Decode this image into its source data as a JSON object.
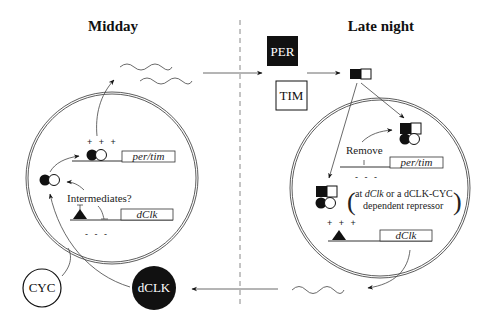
{
  "titles": {
    "left": "Midday",
    "right": "Late night"
  },
  "proteins": {
    "per": "PER",
    "tim": "TIM",
    "cyc": "CYC",
    "dclk": "dCLK"
  },
  "left_cell": {
    "activation_signs": "+ + +",
    "repression_signs": "- - -",
    "gene_per_tim": "per/tim",
    "gene_dclk": "dClk",
    "intermediates_label": "Intermediates?"
  },
  "right_cell": {
    "remove_label": "Remove",
    "repression_signs": "- - -",
    "activation_signs": "+ + +",
    "gene_per_tim": "per/tim",
    "gene_dclk": "dClk",
    "note_line1_prefix": "at ",
    "note_line1_gene": "dClk",
    "note_line1_suffix": " or a dCLK-CYC",
    "note_line2": "dependent repressor"
  },
  "colors": {
    "ink": "#111111",
    "line": "#333333",
    "background": "#ffffff",
    "divider": "#888888"
  }
}
